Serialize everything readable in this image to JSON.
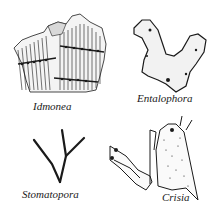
{
  "figure": {
    "panels": [
      {
        "id": "idmonea",
        "label": "Idmonea"
      },
      {
        "id": "entalophora",
        "label": "Entalophora"
      },
      {
        "id": "stomatopora",
        "label": "Stomatopora"
      },
      {
        "id": "crisia",
        "label": "Crisia"
      }
    ],
    "colors": {
      "ink": "#1a1a1a",
      "background": "#ffffff"
    }
  }
}
